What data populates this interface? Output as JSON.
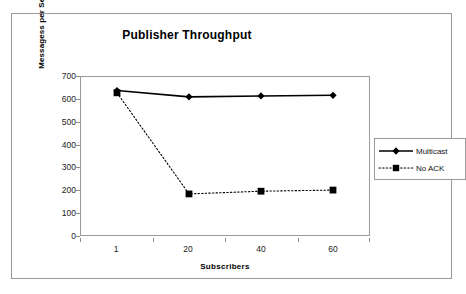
{
  "chart_data": {
    "type": "line",
    "title": "Publisher Throughput",
    "xlabel": "Subscribers",
    "ylabel": "Messagess per Second",
    "categories": [
      "1",
      "20",
      "40",
      "60"
    ],
    "x": [
      1,
      20,
      40,
      60
    ],
    "series": [
      {
        "name": "Multicast",
        "values": [
          640,
          612,
          616,
          619
        ],
        "marker": "diamond",
        "line_style": "solid",
        "color": "#000000"
      },
      {
        "name": "No ACK",
        "values": [
          630,
          182,
          194,
          199
        ],
        "marker": "square",
        "line_style": "dotted",
        "color": "#000000"
      }
    ],
    "ylim": [
      0,
      700
    ],
    "y_ticks": [
      0,
      100,
      200,
      300,
      400,
      500,
      600,
      700
    ],
    "y_tick_labels": [
      "0",
      "100",
      "200",
      "300",
      "400",
      "500",
      "600",
      "700"
    ],
    "x_tick_labels": [
      "1",
      "20",
      "40",
      "60"
    ],
    "grid": false,
    "legend_position": "right",
    "plot_border_color": "#9a9a9a",
    "frame_border_color": "#999999",
    "background_color": "#ffffff"
  }
}
